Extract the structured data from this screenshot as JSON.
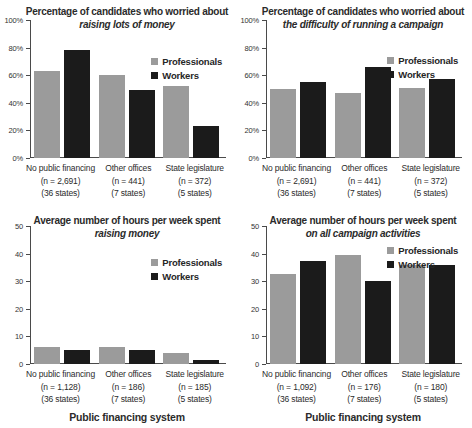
{
  "colors": {
    "professionals": "#9b9b9b",
    "workers": "#1b1b1b",
    "axis": "#4a4a4a",
    "text": "#2b2b2b",
    "background": "#ffffff"
  },
  "chart_data": [
    {
      "type": "bar",
      "position": "top-left",
      "title": "Percentage of candidates who worried about",
      "subtitle": "raising lots of money",
      "ylim": [
        0,
        100
      ],
      "ytick_step": 20,
      "ytick_suffix": "%",
      "grid": false,
      "legend_position": "top-right-inside",
      "legend_top": 36,
      "categories": [
        {
          "name": "No public financing",
          "n": "(n = 2,691)",
          "states": "(36 states)"
        },
        {
          "name": "Other offices",
          "n": "(n = 441)",
          "states": "(7 states)"
        },
        {
          "name": "State legislature",
          "n": "(n = 372)",
          "states": "(5 states)"
        }
      ],
      "series": [
        {
          "name": "Professionals",
          "color": "#9b9b9b",
          "values": [
            63,
            60,
            52
          ]
        },
        {
          "name": "Workers",
          "color": "#1b1b1b",
          "values": [
            78,
            49,
            23
          ]
        }
      ]
    },
    {
      "type": "bar",
      "position": "top-right",
      "title": "Percentage of candidates who worried about",
      "subtitle": "the difficulty of running a campaign",
      "ylim": [
        0,
        100
      ],
      "ytick_step": 20,
      "ytick_suffix": "%",
      "grid": false,
      "legend_position": "top-right-inside",
      "legend_top": 35,
      "categories": [
        {
          "name": "No public financing",
          "n": "(n = 2,691)",
          "states": "(36 states)"
        },
        {
          "name": "Other offices",
          "n": "(n = 441)",
          "states": "(7 states)"
        },
        {
          "name": "State legislature",
          "n": "(n = 372)",
          "states": "(5 states)"
        }
      ],
      "series": [
        {
          "name": "Professionals",
          "color": "#9b9b9b",
          "values": [
            50,
            47,
            51
          ]
        },
        {
          "name": "Workers",
          "color": "#1b1b1b",
          "values": [
            55,
            66,
            57
          ]
        }
      ]
    },
    {
      "type": "bar",
      "position": "bottom-left",
      "title": "Average number of hours per week spent",
      "subtitle": "raising money",
      "xlabel": "Public financing system",
      "ylim": [
        0,
        50
      ],
      "ytick_step": 10,
      "ytick_suffix": "",
      "grid": false,
      "legend_position": "top-right-inside",
      "legend_top": 31,
      "categories": [
        {
          "name": "No public financing",
          "n": "(n = 1,128)",
          "states": "(36 states)"
        },
        {
          "name": "Other offices",
          "n": "(n = 186)",
          "states": "(7 states)"
        },
        {
          "name": "State legislature",
          "n": "(n = 185)",
          "states": "(5 states)"
        }
      ],
      "series": [
        {
          "name": "Professionals",
          "color": "#9b9b9b",
          "values": [
            6,
            6,
            4
          ]
        },
        {
          "name": "Workers",
          "color": "#1b1b1b",
          "values": [
            5,
            5,
            1.3
          ]
        }
      ]
    },
    {
      "type": "bar",
      "position": "bottom-right",
      "title": "Average number of hours per week spent",
      "subtitle": "on all campaign activities",
      "xlabel": "Public financing system",
      "ylim": [
        0,
        50
      ],
      "ytick_step": 10,
      "ytick_suffix": "",
      "grid": false,
      "legend_position": "top-right-inside",
      "legend_top": 19,
      "categories": [
        {
          "name": "No public financing",
          "n": "(n = 1,092)",
          "states": "(36 states)"
        },
        {
          "name": "Other offices",
          "n": "(n = 176)",
          "states": "(7 states)"
        },
        {
          "name": "State legislature",
          "n": "(n = 180)",
          "states": "(5 states)"
        }
      ],
      "series": [
        {
          "name": "Professionals",
          "color": "#9b9b9b",
          "values": [
            32.5,
            39.5,
            36
          ]
        },
        {
          "name": "Workers",
          "color": "#1b1b1b",
          "values": [
            37.5,
            30,
            36
          ]
        }
      ]
    }
  ]
}
